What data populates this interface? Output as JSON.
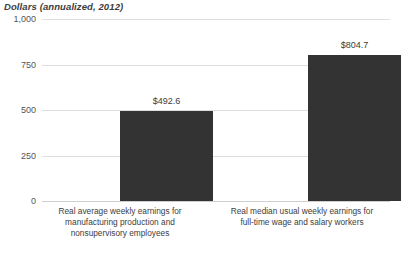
{
  "chart_data": {
    "type": "bar",
    "title": "Dollars (annualized, 2012)",
    "xlabel": "",
    "ylabel": "Dollars (annualized, 2012)",
    "ylim": [
      0,
      1000
    ],
    "grid": true,
    "legend": "none",
    "ytick_labels": [
      "1,000",
      "750",
      "500",
      "250",
      "0"
    ],
    "ytick_values": [
      1000,
      750,
      500,
      250,
      0
    ],
    "categories": [
      "Real average weekly earnings for manufacturing production and nonsupervisory employees",
      "Real median usual weekly earnings for full-time wage and salary workers"
    ],
    "category_lines": [
      [
        "Real average weekly earnings for",
        "manufacturing production and",
        "nonsupervisory employees"
      ],
      [
        "Real median usual weekly earnings for",
        "full-time wage and salary workers"
      ]
    ],
    "values": [
      492.6,
      804.7
    ],
    "value_labels": [
      "$492.6",
      "$804.7"
    ],
    "bar_color": "#333333",
    "gridline_color": "#dedede",
    "background_color": "#ffffff"
  }
}
